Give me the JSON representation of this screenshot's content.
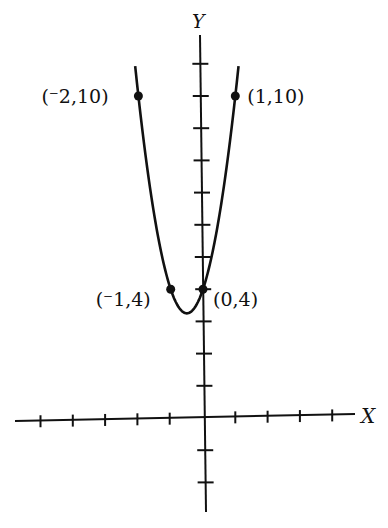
{
  "chart_data": {
    "type": "line",
    "title": "",
    "function": "y = 3x^2 + 3x + 4",
    "xlabel": "X",
    "ylabel": "Y",
    "xlim": [
      -5.8,
      4.8
    ],
    "ylim": [
      -2.9,
      11.7
    ],
    "x_ticks": [
      -5,
      -4,
      -3,
      -2,
      -1,
      1,
      2,
      3,
      4
    ],
    "y_ticks": [
      -2,
      -1,
      1,
      2,
      3,
      4,
      5,
      6,
      7,
      8,
      9,
      10,
      11
    ],
    "grid": false,
    "curve_x_range": [
      -2.1,
      1.1
    ],
    "points": [
      {
        "x": -2,
        "y": 10,
        "label": "(⁻2,10)"
      },
      {
        "x": 1,
        "y": 10,
        "label": "(1,10)"
      },
      {
        "x": -1,
        "y": 4,
        "label": "(⁻1,4)"
      },
      {
        "x": 0,
        "y": 4,
        "label": "(0,4)"
      }
    ],
    "colors": {
      "curve": "#111111",
      "axes": "#111111",
      "background": "#ffffff"
    }
  },
  "axes": {
    "x_label": "X",
    "y_label": "Y"
  }
}
